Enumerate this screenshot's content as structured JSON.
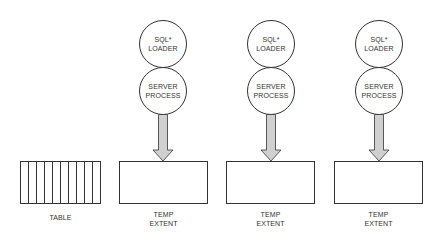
{
  "table": {
    "label": "TABLE",
    "columns": 10
  },
  "groups": [
    {
      "loader": [
        "SQL*",
        "LOADER"
      ],
      "server": [
        "SERVER",
        "PROCESS"
      ],
      "extent": [
        "TEMP",
        "EXTENT"
      ],
      "cx": 163,
      "box_x": 119
    },
    {
      "loader": [
        "SQL*",
        "LOADER"
      ],
      "server": [
        "SERVER",
        "PROCESS"
      ],
      "extent": [
        "TEMP",
        "EXTENT"
      ],
      "cx": 271,
      "box_x": 226
    },
    {
      "loader": [
        "SQL*",
        "LOADER"
      ],
      "server": [
        "SERVER",
        "PROCESS"
      ],
      "extent": [
        "TEMP",
        "EXTENT"
      ],
      "cx": 379,
      "box_x": 334
    }
  ],
  "colors": {
    "line": "#333333",
    "arrow_fill": "#d0d0d0",
    "background": "#ffffff"
  }
}
